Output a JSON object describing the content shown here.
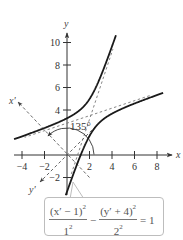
{
  "chart_data": {
    "type": "line",
    "title": "",
    "xlabel": "x",
    "ylabel": "y",
    "rotated_xlabel": "x'",
    "rotated_ylabel": "y'",
    "xlim": [
      -5,
      9.5
    ],
    "ylim": [
      -3.5,
      11
    ],
    "x_ticks": [
      -4,
      -2,
      2,
      4,
      6,
      8
    ],
    "x_tick_labels": [
      "−4",
      "−2",
      "2",
      "4",
      "6",
      "8"
    ],
    "y_ticks": [
      -2,
      4,
      6,
      8,
      10
    ],
    "y_tick_labels": [
      "−2",
      "4",
      "6",
      "8",
      "10"
    ],
    "grid": false,
    "rotation_angle_label": "135°",
    "rotation_angle_deg": 135,
    "curve": {
      "name": "hyperbola",
      "equation_rotated": "(x' − 1)²/1² − (y' + 4)²/2² = 1",
      "center_rotated": [
        1,
        -4
      ],
      "a": 1,
      "b": 2,
      "center_xy": [
        2.12,
        3.54
      ],
      "left_branch_samples_xy": [
        [
          -4.6,
          1.8
        ],
        [
          -2,
          2.6
        ],
        [
          0,
          3.3
        ],
        [
          1,
          4.2
        ],
        [
          2,
          6.2
        ],
        [
          3.2,
          10.6
        ]
      ],
      "right_branch_samples_xy": [
        [
          1.4,
          -3.4
        ],
        [
          1.8,
          0
        ],
        [
          2.2,
          1.9
        ],
        [
          3,
          2.9
        ],
        [
          5,
          4
        ],
        [
          8.5,
          5.6
        ]
      ]
    },
    "asymptotes": "dashed lines through center (2.12, 3.54)",
    "equation_box": {
      "term1_num": "(x′ − 1)",
      "term1_num_exp": "2",
      "term1_den": "1",
      "term1_den_exp": "2",
      "minus": "−",
      "term2_num": "(y′ + 4)",
      "term2_num_exp": "2",
      "term2_den": "2",
      "term2_den_exp": "2",
      "equals": "= 1"
    }
  },
  "colors": {
    "curve": "#1a1a1a",
    "axis": "#333333",
    "dashed": "#6e6e6e",
    "box_border": "#bdbdbd"
  }
}
